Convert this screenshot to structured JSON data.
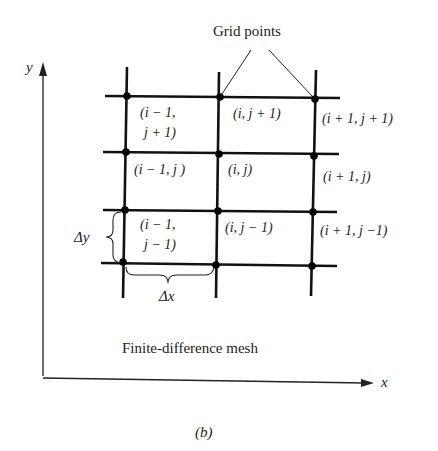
{
  "figure": {
    "panel_label": "(b)",
    "caption": "Finite-difference mesh",
    "callout": "Grid points",
    "axes": {
      "x_label": "x",
      "y_label": "y"
    },
    "spacing": {
      "dx_label": "Δx",
      "dy_label": "Δy"
    }
  },
  "cells": [
    {
      "row": 0,
      "col": 0,
      "line1": "(i − 1,",
      "line2": "j + 1)"
    },
    {
      "row": 0,
      "col": 1,
      "line1": "(i, j + 1)",
      "line2": ""
    },
    {
      "row": 0,
      "col": 2,
      "line1": "(i + 1, j + 1)",
      "line2": ""
    },
    {
      "row": 1,
      "col": 0,
      "line1": "(i − 1, j )",
      "line2": ""
    },
    {
      "row": 1,
      "col": 1,
      "line1": "(i, j)",
      "line2": ""
    },
    {
      "row": 1,
      "col": 2,
      "line1": "(i + 1, j)",
      "line2": ""
    },
    {
      "row": 2,
      "col": 0,
      "line1": "(i − 1,",
      "line2": "j − 1)"
    },
    {
      "row": 2,
      "col": 1,
      "line1": "(i, j − 1)",
      "line2": ""
    },
    {
      "row": 2,
      "col": 2,
      "line1": "(i + 1, j −1)",
      "line2": ""
    }
  ]
}
